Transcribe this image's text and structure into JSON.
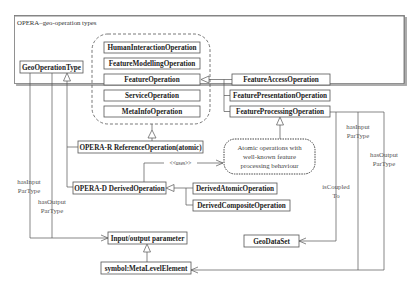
{
  "frame": {
    "title": "OPERA–geo-operation types"
  },
  "classes": {
    "geo_operation_type": "GeoOperationType",
    "human_interaction": "HumanInteractionOperation",
    "feature_modelling": "FeatureModellingOperation",
    "feature_operation": "FeatureOperation",
    "service_operation": "ServiceOperation",
    "metainfo_operation": "MetaInfoOperation",
    "feature_access": "FeatureAccessOperation",
    "feature_presentation": "FeaturePresentationOperation",
    "feature_processing": "FeatureProcessingOperation",
    "reference_operation": "OPERA-R ReferenceOperation(atomic)",
    "derived_operation": "OPERA-D DerivedOperation",
    "derived_atomic": "DerivedAtomicOperation",
    "derived_composite": "DerivedCompositeOperation",
    "io_parameter": "Input/output parameter",
    "metalevel_element": "symbol:MetaLevelElement",
    "geodataset": "GeoDataSet"
  },
  "note": {
    "line1": "Atomic operations with",
    "line2": "well-known feature",
    "line3": "processing behaviour"
  },
  "labels": {
    "uses": "<<uses>>",
    "left_has_input_1": "hasInput",
    "left_has_input_2": "ParType",
    "left_has_output_1": "hasOutput",
    "left_has_output_2": "ParType",
    "right_has_input_1": "hasInput",
    "right_has_input_2": "ParType",
    "right_has_output_1": "hasOutput",
    "right_has_output_2": "ParType",
    "is_coupled_1": "isCoupled",
    "is_coupled_2": "To"
  }
}
